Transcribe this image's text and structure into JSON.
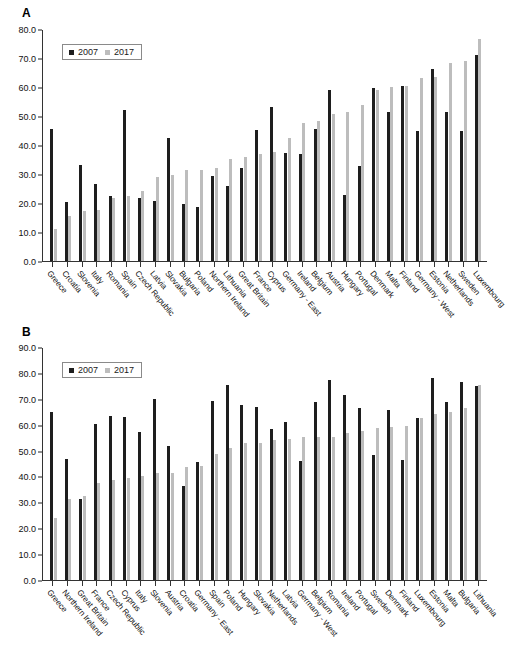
{
  "figure": {
    "panel_a_letter": "A",
    "panel_b_letter": "B"
  },
  "legend": {
    "series_2007": "2007",
    "series_2017": "2017",
    "color_2007": "#1e1e1e",
    "color_2017": "#bdbdbd"
  },
  "chart_data": [
    {
      "type": "bar",
      "panel": "A",
      "title": "",
      "xlabel": "",
      "ylabel": "",
      "ylim": [
        0,
        80
      ],
      "ytick_step": 10,
      "ytick_labels": [
        "0.0",
        "10.0",
        "20.0",
        "30.0",
        "40.0",
        "50.0",
        "60.0",
        "70.0",
        "80.0"
      ],
      "grid": false,
      "legend_position": "top-left",
      "categories": [
        "Greece",
        "Croatia",
        "Slovenia",
        "Italy",
        "Romania",
        "Spain",
        "Czech Republic",
        "Latvia",
        "Slovakia",
        "Bulgaria",
        "Poland",
        "Northern Ireland",
        "Lithuania",
        "Great Britain",
        "France",
        "Cyprus",
        "Germany - East",
        "Ireland",
        "Belgium",
        "Austria",
        "Hungary",
        "Portugal",
        "Denmark",
        "Malta",
        "Finland",
        "Germany - West",
        "Estonia",
        "Netherlands",
        "Sweden",
        "Luxembourg"
      ],
      "series": [
        {
          "name": "2007",
          "values": [
            45.4,
            20.4,
            33.1,
            26.6,
            22.3,
            52.2,
            21.7,
            20.7,
            42.4,
            19.6,
            18.6,
            29.3,
            25.8,
            32.2,
            45.3,
            53.0,
            37.3,
            36.9,
            45.4,
            58.8,
            22.6,
            32.7,
            59.7,
            51.5,
            60.3,
            44.7,
            66.3,
            51.4,
            45.0,
            71.2
          ]
        },
        {
          "name": "2017",
          "values": [
            11.0,
            15.4,
            17.3,
            17.7,
            21.6,
            22.4,
            24.1,
            29.0,
            29.8,
            31.3,
            31.4,
            32.0,
            35.2,
            35.9,
            36.8,
            37.5,
            42.4,
            47.7,
            48.3,
            50.6,
            51.3,
            53.8,
            59.1,
            60.1,
            60.2,
            63.2,
            63.4,
            68.3,
            69.0,
            76.5
          ]
        }
      ]
    },
    {
      "type": "bar",
      "panel": "B",
      "title": "",
      "xlabel": "",
      "ylabel": "",
      "ylim": [
        0,
        90
      ],
      "ytick_step": 10,
      "ytick_labels": [
        "0.0",
        "10.0",
        "20.0",
        "30.0",
        "40.0",
        "50.0",
        "60.0",
        "70.0",
        "80.0",
        "90.0"
      ],
      "grid": false,
      "legend_position": "top-left",
      "categories": [
        "Greece",
        "Northern Ireland",
        "Great Britain",
        "France",
        "Czech Republic",
        "Cyprus",
        "Italy",
        "Slovenia",
        "Austria",
        "Croatia",
        "Germany - East",
        "Spain",
        "Poland",
        "Hungary",
        "Slovakia",
        "Netherlands",
        "Latvia",
        "Germany - West",
        "Belgium",
        "Romania",
        "Ireland",
        "Portugal",
        "Sweden",
        "Denmark",
        "Finland",
        "Luxembourg",
        "Estonia",
        "Malta",
        "Bulgaria",
        "Lithuania"
      ],
      "series": [
        {
          "name": "2007",
          "values": [
            64.9,
            46.9,
            31.3,
            60.2,
            63.4,
            62.8,
            57.0,
            69.8,
            51.8,
            36.2,
            45.5,
            69.1,
            75.4,
            67.6,
            66.8,
            58.2,
            61.1,
            45.9,
            68.6,
            77.2,
            71.6,
            66.3,
            48.1,
            65.6,
            46.5,
            62.5,
            78.1,
            68.8,
            76.6,
            75.0
          ]
        },
        {
          "name": "2017",
          "values": [
            23.9,
            31.2,
            32.4,
            37.3,
            38.6,
            39.4,
            40.0,
            41.2,
            41.3,
            43.7,
            44.1,
            48.7,
            51.0,
            53.0,
            53.1,
            53.9,
            54.3,
            55.3,
            55.3,
            55.4,
            56.9,
            57.6,
            58.7,
            59.2,
            59.3,
            62.5,
            64.3,
            65.0,
            66.6,
            75.5
          ]
        }
      ]
    }
  ]
}
